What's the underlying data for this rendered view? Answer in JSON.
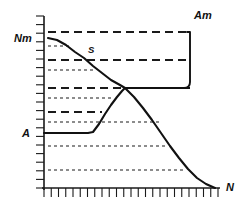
{
  "figure": {
    "title": "",
    "background_color": "#ffffff",
    "ink_color": "#1a1a1a",
    "width": 244,
    "height": 210
  },
  "labels": {
    "y_axis_top": "Nm",
    "y_axis_low": "A",
    "x_axis_end": "N",
    "saturation_point": "S",
    "bracket_right": "Am"
  },
  "axes": {
    "x_axis_label": "N",
    "y_axis_label": "Nm",
    "x_tick_count": 24,
    "y_tick_count": 20,
    "grid": "dashed-horizontal",
    "origin_px": [
      44,
      188
    ],
    "x_end_px": [
      218,
      188
    ],
    "y_end_px": [
      44,
      16
    ]
  },
  "chart_data": {
    "type": "line",
    "title": "",
    "xlabel": "N",
    "ylabel": "Nm",
    "xlim": [
      0,
      24
    ],
    "ylim": [
      0,
      20
    ],
    "grid": true,
    "legend": "none",
    "annotations": [
      {
        "text": "Nm",
        "x_px": 14,
        "y_px": 42,
        "role": "y-axis-max-label"
      },
      {
        "text": "A",
        "x_px": 22,
        "y_px": 136,
        "role": "y-axis-base-label"
      },
      {
        "text": "S",
        "x_px": 90,
        "y_px": 52,
        "role": "curve-point-label"
      },
      {
        "text": "Am",
        "x_px": 196,
        "y_px": 17,
        "role": "bracket-label"
      },
      {
        "text": "N",
        "x_px": 226,
        "y_px": 186,
        "role": "x-axis-end-label"
      }
    ],
    "series": [
      {
        "name": "Nm-curve",
        "style": "solid",
        "description": "Torque curve descending from Nm at left to zero at N on the right",
        "points_px": [
          [
            48,
            38
          ],
          [
            57,
            40
          ],
          [
            66,
            45
          ],
          [
            75,
            52
          ],
          [
            84,
            58
          ],
          [
            93,
            66
          ],
          [
            102,
            73
          ],
          [
            111,
            80
          ],
          [
            120,
            85
          ],
          [
            125,
            88
          ],
          [
            134,
            97
          ],
          [
            143,
            108
          ],
          [
            152,
            120
          ],
          [
            161,
            133
          ],
          [
            170,
            146
          ],
          [
            179,
            158
          ],
          [
            188,
            169
          ],
          [
            197,
            178
          ],
          [
            206,
            184
          ],
          [
            215,
            188
          ]
        ]
      },
      {
        "name": "A-curve",
        "style": "solid",
        "description": "Power curve flat at A then rising steeply to intersect the Nm-curve",
        "points_px": [
          [
            44,
            133
          ],
          [
            60,
            133
          ],
          [
            75,
            133
          ],
          [
            88,
            133
          ],
          [
            93,
            132
          ],
          [
            99,
            124
          ],
          [
            105,
            114
          ],
          [
            111,
            105
          ],
          [
            117,
            97
          ],
          [
            122,
            91
          ],
          [
            125,
            88
          ]
        ]
      },
      {
        "name": "A-plateau-right",
        "style": "solid",
        "description": "Horizontal solid segment continuing right from the intersection to the Am bracket",
        "points_px": [
          [
            125,
            88
          ],
          [
            190,
            88
          ]
        ]
      }
    ],
    "gridlines": [
      {
        "y_px": 32,
        "style": "long-dash",
        "x_from": 48,
        "x_to": 190
      },
      {
        "y_px": 46,
        "style": "short-dash",
        "x_from": 48,
        "x_to": 72
      },
      {
        "y_px": 60,
        "style": "long-dash",
        "x_from": 48,
        "x_to": 190
      },
      {
        "y_px": 70,
        "style": "short-dash",
        "x_from": 48,
        "x_to": 96
      },
      {
        "y_px": 88,
        "style": "long-dash",
        "x_from": 48,
        "x_to": 122
      },
      {
        "y_px": 98,
        "style": "short-dash",
        "x_from": 48,
        "x_to": 112
      },
      {
        "y_px": 112,
        "style": "long-dash",
        "x_from": 48,
        "x_to": 102
      },
      {
        "y_px": 122,
        "style": "short-dash",
        "x_from": 48,
        "x_to": 160
      },
      {
        "y_px": 146,
        "style": "short-dash",
        "x_from": 48,
        "x_to": 168
      },
      {
        "y_px": 170,
        "style": "short-dash",
        "x_from": 48,
        "x_to": 186
      }
    ],
    "bracket": {
      "x_px": 190,
      "y_top_px": 32,
      "y_bottom_px": 88,
      "label": "Am"
    }
  }
}
